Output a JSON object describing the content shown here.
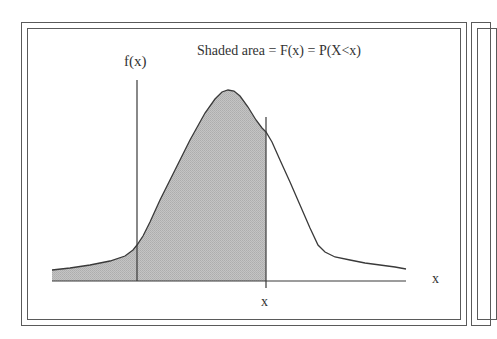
{
  "diagram": {
    "title": "Shaded area = F(x) = P(X<x)",
    "y_axis_label": "f(x)",
    "x_marker_label": "x",
    "x_axis_label": "x",
    "colors": {
      "shade": "#bdbdbd",
      "line": "#3a3a3a",
      "frame": "#5a5a5a",
      "background": "#ffffff"
    }
  }
}
